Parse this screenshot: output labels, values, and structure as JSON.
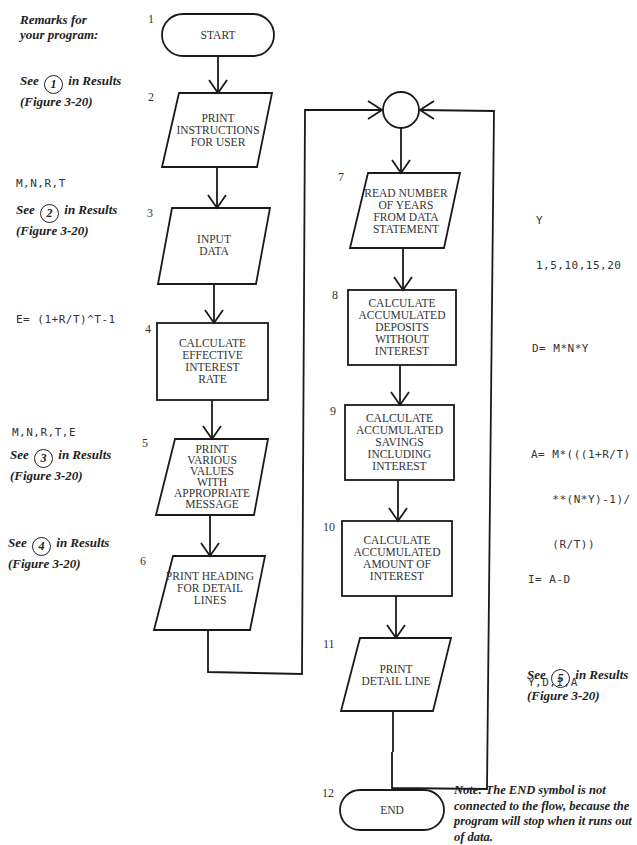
{
  "remarks_header": [
    "Remarks for",
    "your program:"
  ],
  "steps": [
    {
      "num": "1",
      "type": "terminal",
      "lines": [
        "START"
      ]
    },
    {
      "num": "2",
      "type": "io",
      "lines": [
        "PRINT",
        "INSTRUCTIONS",
        "FOR USER"
      ]
    },
    {
      "num": "3",
      "type": "io",
      "lines": [
        "INPUT",
        "DATA"
      ]
    },
    {
      "num": "4",
      "type": "process",
      "lines": [
        "CALCULATE",
        "EFFECTIVE",
        "INTEREST",
        "RATE"
      ]
    },
    {
      "num": "5",
      "type": "io",
      "lines": [
        "PRINT",
        "VARIOUS",
        "VALUES",
        "WITH",
        "APPROPRIATE",
        "MESSAGE"
      ]
    },
    {
      "num": "6",
      "type": "io",
      "lines": [
        "PRINT HEADING",
        "FOR DETAIL",
        "LINES"
      ]
    },
    {
      "num": "7",
      "type": "io",
      "lines": [
        "READ NUMBER",
        "OF YEARS",
        "FROM DATA",
        "STATEMENT"
      ]
    },
    {
      "num": "8",
      "type": "process",
      "lines": [
        "CALCULATE",
        "ACCUMULATED",
        "DEPOSITS WITHOUT",
        "INTEREST"
      ]
    },
    {
      "num": "9",
      "type": "process",
      "lines": [
        "CALCULATE",
        "ACCUMULATED",
        "SAVINGS INCLUDING",
        "INTEREST"
      ]
    },
    {
      "num": "10",
      "type": "process",
      "lines": [
        "CALCULATE",
        "ACCUMULATED",
        "AMOUNT OF",
        "INTEREST"
      ]
    },
    {
      "num": "11",
      "type": "io",
      "lines": [
        "PRINT",
        "DETAIL LINE"
      ]
    },
    {
      "num": "12",
      "type": "terminal",
      "lines": [
        "END"
      ]
    }
  ],
  "left_remarks": [
    {
      "see_prefix": "See",
      "circle_num": "1",
      "see_suffix": "in Results",
      "figure": "(Figure 3-20)"
    },
    {
      "code": "M,N,R,T",
      "see_prefix": "See",
      "circle_num": "2",
      "see_suffix": "in Results",
      "figure": "(Figure 3-20)"
    },
    {
      "code": "E= (1+R/T)^T-1"
    },
    {
      "code": "M,N,R,T,E",
      "see_prefix": "See",
      "circle_num": "3",
      "see_suffix": "in Results",
      "figure": "(Figure 3-20)"
    },
    {
      "see_prefix": "See",
      "circle_num": "4",
      "see_suffix": "in Results",
      "figure": "(Figure 3-20)"
    }
  ],
  "right_remarks": [
    {
      "code_lines": [
        "Y",
        "1,5,10,15,20"
      ]
    },
    {
      "code_lines": [
        "D= M*N*Y"
      ]
    },
    {
      "code_lines": [
        "A= M*(((1+R/T)",
        "   **(N*Y)-1)/",
        "   (R/T))"
      ]
    },
    {
      "code_lines": [
        "I= A-D"
      ]
    },
    {
      "code_lines": [
        "Y,D,I,A"
      ],
      "see_prefix": "See",
      "circle_num": "5",
      "see_suffix": "in Results",
      "figure": "(Figure 3-20)"
    }
  ],
  "note": "Note: The END symbol is not connected to the flow, because the program will stop when it runs out of data.",
  "colors": {
    "line": "#1a1a1a",
    "background": "#ffffff",
    "text": "#333333"
  }
}
